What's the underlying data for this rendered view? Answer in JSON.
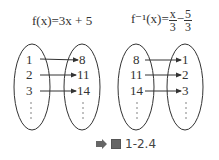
{
  "diagram_left": {
    "formula_lhs": "f(x)=3x + 5",
    "domain": [
      "1",
      "2",
      "3"
    ],
    "range": [
      "8",
      "11",
      "14"
    ],
    "ellipsis": "⋮"
  },
  "diagram_right": {
    "formula_lhs": "f⁻¹(x)=",
    "frac1_num": "x",
    "frac1_den": "3",
    "minus": "−",
    "frac2_num": "5",
    "frac2_den": "3",
    "domain": [
      "8",
      "11",
      "14"
    ],
    "range": [
      "1",
      "2",
      "3"
    ],
    "ellipsis": "⋮"
  },
  "caption": {
    "label": "1-2.4",
    "icons": [
      "arrow-right-icon",
      "image-icon"
    ]
  },
  "colors": {
    "stroke": "#333333",
    "caption_icon": "#666666"
  }
}
